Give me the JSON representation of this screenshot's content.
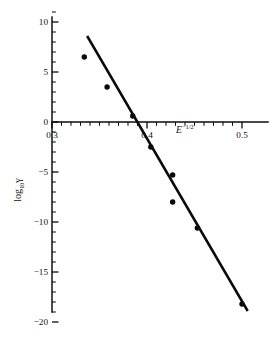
{
  "chart_data": {
    "type": "scatter",
    "title": "",
    "subtitle": "",
    "xlabel": "E^-1/2",
    "xlabel_base": "E",
    "xlabel_exponent": "−1/2",
    "ylabel": "log10 γ",
    "ylabel_base": "log",
    "ylabel_subscript": "10",
    "ylabel_symbol": "γ",
    "xlim": [
      0.3,
      0.506
    ],
    "ylim": [
      -20.5,
      11.5
    ],
    "x_ticks_major": [
      0.3,
      0.4,
      0.5
    ],
    "x_tick_labels": [
      "0.3",
      "0.4",
      "0.5"
    ],
    "x_minor_step": 0.01,
    "y_ticks_major": [
      10,
      5,
      0,
      -5,
      -10,
      -15,
      -20
    ],
    "y_tick_labels": [
      "10",
      "5",
      "0",
      "−5",
      "−10",
      "−15",
      "−20"
    ],
    "y_minor_step": 1,
    "grid": false,
    "legend": false,
    "legend_position": "none",
    "axis_style": "crossed-at-zero",
    "marker": "filled-circle",
    "marker_color": "#0a0a0a",
    "line_color": "#0a0a0a",
    "points": [
      {
        "x": 0.334,
        "y": 6.5
      },
      {
        "x": 0.358,
        "y": 3.5
      },
      {
        "x": 0.385,
        "y": 0.6
      },
      {
        "x": 0.404,
        "y": -2.5
      },
      {
        "x": 0.427,
        "y": -5.3
      },
      {
        "x": 0.427,
        "y": -8.0
      },
      {
        "x": 0.453,
        "y": -10.6
      },
      {
        "x": 0.5,
        "y": -18.2
      }
    ],
    "fit_line": {
      "name": "linear fit",
      "x_start": 0.337,
      "y_start": 8.6,
      "x_end": 0.506,
      "y_end": -18.9,
      "slope": -162.7,
      "intercept": 63.4
    }
  }
}
